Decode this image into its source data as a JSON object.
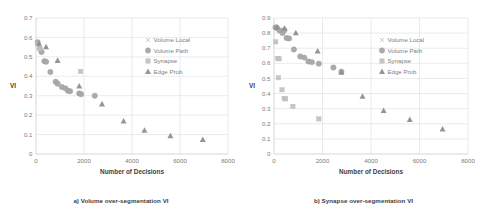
{
  "figure": {
    "panels": [
      {
        "id": "panel-a",
        "caption": "a) Volume over-segmentation VI",
        "chart_data": {
          "type": "scatter",
          "title": "",
          "xlabel": "Number of Decisions",
          "ylabel": "VI",
          "xlim": [
            0,
            8000
          ],
          "ylim": [
            0,
            0.7
          ],
          "xticks": [
            0,
            2000,
            4000,
            6000,
            8000
          ],
          "yticks": [
            0,
            0.1,
            0.2,
            0.3,
            0.4,
            0.5,
            0.6,
            0.7
          ],
          "xtick_labels": [
            "0",
            "2000",
            "4000",
            "6000",
            "8000"
          ],
          "ytick_labels": [
            "0",
            "0.1",
            "0.2",
            "0.3",
            "0.4",
            "0.5",
            "0.6",
            "0.7"
          ],
          "grid": true,
          "legend_position": "top-right",
          "series": [
            {
              "name": "Volume Local",
              "marker": "x",
              "color": "#c8c8c8",
              "points": [
                [
                  60,
                  0.572
                ],
                [
                  130,
                  0.545
                ],
                [
                  1850,
                  0.425
                ]
              ]
            },
            {
              "name": "Volume Path",
              "marker": "circle",
              "color": "#a6a6a6",
              "points": [
                [
                  70,
                  0.575
                ],
                [
                  150,
                  0.545
                ],
                [
                  230,
                  0.525
                ],
                [
                  350,
                  0.478
                ],
                [
                  420,
                  0.475
                ],
                [
                  600,
                  0.422
                ],
                [
                  820,
                  0.372
                ],
                [
                  900,
                  0.362
                ],
                [
                  1080,
                  0.345
                ],
                [
                  1230,
                  0.338
                ],
                [
                  1330,
                  0.325
                ],
                [
                  1420,
                  0.323
                ],
                [
                  1800,
                  0.312
                ],
                [
                  1880,
                  0.308
                ],
                [
                  2450,
                  0.3
                ]
              ]
            },
            {
              "name": "Synapse",
              "marker": "square",
              "color": "#c2c2c2",
              "points": [
                [
                  65,
                  0.568
                ],
                [
                  140,
                  0.542
                ],
                [
                  1860,
                  0.425
                ]
              ]
            },
            {
              "name": "Edge Prob",
              "marker": "triangle",
              "color": "#8f8f8f",
              "points": [
                [
                  120,
                  0.57
                ],
                [
                  420,
                  0.552
                ],
                [
                  900,
                  0.482
                ],
                [
                  1800,
                  0.35
                ],
                [
                  2750,
                  0.258
                ],
                [
                  3650,
                  0.17
                ],
                [
                  4520,
                  0.122
                ],
                [
                  5600,
                  0.094
                ],
                [
                  6950,
                  0.075
                ]
              ]
            }
          ]
        }
      },
      {
        "id": "panel-b",
        "caption": "b) Synapse over-segmentation VI",
        "chart_data": {
          "type": "scatter",
          "title": "",
          "xlabel": "Number of Decisions",
          "ylabel": "VI",
          "xlim": [
            0,
            8000
          ],
          "ylim": [
            0,
            0.9
          ],
          "xticks": [
            0,
            2000,
            4000,
            6000,
            8000
          ],
          "yticks": [
            0,
            0.1,
            0.2,
            0.3,
            0.4,
            0.5,
            0.6,
            0.7,
            0.8,
            0.9
          ],
          "xtick_labels": [
            "0",
            "2000",
            "4000",
            "6000",
            "8000"
          ],
          "ytick_labels": [
            "0",
            "0.1",
            "0.2",
            "0.3",
            "0.4",
            "0.5",
            "0.6",
            "0.7",
            "0.8",
            "0.9"
          ],
          "grid": true,
          "legend_position": "top-right",
          "series": [
            {
              "name": "Volume Local",
              "marker": "x",
              "color": "#c8c8c8",
              "points": [
                [
                  70,
                  0.835
                ],
                [
                  150,
                  0.825
                ]
              ]
            },
            {
              "name": "Volume Path",
              "marker": "circle",
              "color": "#a6a6a6",
              "points": [
                [
                  60,
                  0.838
                ],
                [
                  120,
                  0.835
                ],
                [
                  230,
                  0.818
                ],
                [
                  350,
                  0.8
                ],
                [
                  430,
                  0.82
                ],
                [
                  520,
                  0.768
                ],
                [
                  620,
                  0.765
                ],
                [
                  820,
                  0.692
                ],
                [
                  1080,
                  0.645
                ],
                [
                  1250,
                  0.638
                ],
                [
                  1420,
                  0.612
                ],
                [
                  1560,
                  0.608
                ],
                [
                  1850,
                  0.598
                ],
                [
                  2450,
                  0.572
                ],
                [
                  2780,
                  0.545
                ]
              ]
            },
            {
              "name": "Synapse",
              "marker": "square",
              "color": "#c2c2c2",
              "points": [
                [
                  70,
                  0.742
                ],
                [
                  150,
                  0.632
                ],
                [
                  210,
                  0.63
                ],
                [
                  180,
                  0.505
                ],
                [
                  330,
                  0.425
                ],
                [
                  420,
                  0.368
                ],
                [
                  480,
                  0.365
                ],
                [
                  780,
                  0.315
                ],
                [
                  1850,
                  0.232
                ]
              ]
            },
            {
              "name": "Edge Prob",
              "marker": "triangle",
              "color": "#8f8f8f",
              "points": [
                [
                  120,
                  0.84
                ],
                [
                  430,
                  0.832
                ],
                [
                  900,
                  0.802
                ],
                [
                  1800,
                  0.682
                ],
                [
                  2780,
                  0.542
                ],
                [
                  3650,
                  0.382
                ],
                [
                  4520,
                  0.288
                ],
                [
                  5600,
                  0.228
                ],
                [
                  6950,
                  0.165
                ]
              ]
            }
          ]
        }
      }
    ]
  }
}
